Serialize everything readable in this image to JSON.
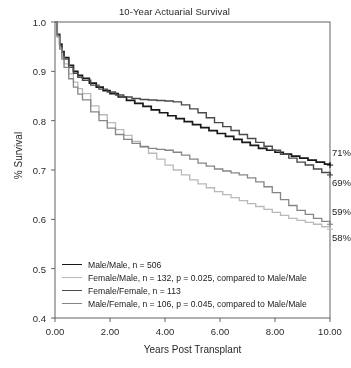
{
  "chart_data": {
    "type": "line",
    "title": "10-Year Actuarial Survival",
    "xlabel": "Years Post Transplant",
    "ylabel": "% Survival",
    "xlim": [
      0,
      10
    ],
    "ylim": [
      0.4,
      1.0
    ],
    "xticks": [
      "0.00",
      "2.00",
      "4.00",
      "6.00",
      "8.00",
      "10.00"
    ],
    "xtick_values": [
      0,
      2,
      4,
      6,
      8,
      10
    ],
    "yticks": [
      "0.4",
      "0.5",
      "0.6",
      "0.7",
      "0.8",
      "0.9",
      "1.0"
    ],
    "ytick_values": [
      0.4,
      0.5,
      0.6,
      0.7,
      0.8,
      0.9,
      1.0
    ],
    "grid": false,
    "legend_position": "lower-left-inside",
    "series": [
      {
        "name": "Male/Male",
        "label": "Male/Male, n = 506",
        "n": 506,
        "p_value": null,
        "color": "#1a1a1a",
        "width": 1.7,
        "endpoint_label": "71%",
        "endpoint_value": 0.71,
        "x": [
          0.0,
          0.08,
          0.17,
          0.25,
          0.33,
          0.5,
          0.67,
          0.83,
          1.0,
          1.25,
          1.5,
          1.75,
          2.0,
          2.3,
          2.6,
          2.9,
          3.2,
          3.5,
          3.8,
          4.1,
          4.4,
          4.7,
          5.0,
          5.3,
          5.6,
          5.9,
          6.2,
          6.5,
          6.8,
          7.1,
          7.4,
          7.7,
          8.0,
          8.3,
          8.6,
          8.9,
          9.2,
          9.5,
          9.8,
          10.0
        ],
        "y": [
          1.0,
          0.975,
          0.955,
          0.94,
          0.928,
          0.912,
          0.9,
          0.892,
          0.886,
          0.876,
          0.868,
          0.861,
          0.855,
          0.848,
          0.841,
          0.835,
          0.829,
          0.822,
          0.816,
          0.81,
          0.804,
          0.798,
          0.792,
          0.786,
          0.78,
          0.774,
          0.768,
          0.762,
          0.756,
          0.75,
          0.744,
          0.74,
          0.736,
          0.732,
          0.728,
          0.724,
          0.72,
          0.716,
          0.712,
          0.71
        ]
      },
      {
        "name": "Female/Male",
        "label": "Female/Male, n = 132, p = 0.025, compared to Male/Male",
        "n": 132,
        "p_value": 0.025,
        "color": "#b9b9b9",
        "width": 1.3,
        "endpoint_label": "58%",
        "endpoint_value": 0.58,
        "x": [
          0.0,
          0.08,
          0.17,
          0.25,
          0.33,
          0.5,
          0.67,
          0.83,
          1.0,
          1.3,
          1.6,
          1.9,
          2.2,
          2.5,
          2.8,
          3.1,
          3.4,
          3.7,
          4.0,
          4.3,
          4.6,
          4.9,
          5.2,
          5.5,
          5.8,
          6.1,
          6.4,
          6.7,
          7.0,
          7.3,
          7.6,
          7.9,
          8.2,
          8.5,
          8.8,
          9.1,
          9.4,
          9.7,
          10.0
        ],
        "y": [
          1.0,
          0.972,
          0.948,
          0.93,
          0.915,
          0.895,
          0.878,
          0.865,
          0.855,
          0.83,
          0.812,
          0.796,
          0.782,
          0.77,
          0.758,
          0.746,
          0.734,
          0.722,
          0.71,
          0.7,
          0.69,
          0.68,
          0.672,
          0.664,
          0.656,
          0.65,
          0.644,
          0.638,
          0.632,
          0.626,
          0.62,
          0.614,
          0.608,
          0.602,
          0.598,
          0.594,
          0.59,
          0.585,
          0.58
        ]
      },
      {
        "name": "Female/Female",
        "label": "Female/Female, n = 113",
        "n": 113,
        "p_value": null,
        "color": "#4a4a4a",
        "width": 1.4,
        "endpoint_label": "69%",
        "endpoint_value": 0.69,
        "x": [
          0.0,
          0.08,
          0.17,
          0.25,
          0.33,
          0.5,
          0.67,
          0.83,
          1.0,
          1.3,
          1.6,
          1.9,
          2.2,
          2.5,
          2.8,
          3.1,
          3.4,
          3.7,
          4.0,
          4.3,
          4.6,
          4.9,
          5.2,
          5.5,
          5.8,
          6.1,
          6.4,
          6.7,
          7.0,
          7.3,
          7.6,
          7.9,
          8.2,
          8.5,
          8.8,
          9.1,
          9.4,
          9.7,
          10.0
        ],
        "y": [
          1.0,
          0.974,
          0.952,
          0.938,
          0.925,
          0.908,
          0.896,
          0.888,
          0.882,
          0.872,
          0.864,
          0.858,
          0.852,
          0.848,
          0.845,
          0.843,
          0.842,
          0.841,
          0.84,
          0.838,
          0.832,
          0.824,
          0.816,
          0.806,
          0.796,
          0.788,
          0.78,
          0.772,
          0.764,
          0.756,
          0.748,
          0.74,
          0.732,
          0.724,
          0.716,
          0.71,
          0.702,
          0.695,
          0.69
        ]
      },
      {
        "name": "Male/Female",
        "label": "Male/Female, n = 106, p = 0.045, compared to Male/Male",
        "n": 106,
        "p_value": 0.045,
        "color": "#868686",
        "width": 1.3,
        "endpoint_label": "59%",
        "endpoint_value": 0.59,
        "x": [
          0.0,
          0.08,
          0.17,
          0.25,
          0.33,
          0.5,
          0.67,
          0.83,
          1.0,
          1.3,
          1.6,
          1.9,
          2.2,
          2.5,
          2.8,
          3.1,
          3.4,
          3.7,
          4.0,
          4.3,
          4.6,
          4.9,
          5.2,
          5.5,
          5.8,
          6.1,
          6.4,
          6.7,
          7.0,
          7.3,
          7.6,
          7.9,
          8.2,
          8.5,
          8.8,
          9.1,
          9.4,
          9.7,
          10.0
        ],
        "y": [
          1.0,
          0.97,
          0.945,
          0.925,
          0.908,
          0.885,
          0.868,
          0.854,
          0.842,
          0.818,
          0.8,
          0.785,
          0.772,
          0.762,
          0.754,
          0.748,
          0.744,
          0.742,
          0.74,
          0.736,
          0.73,
          0.722,
          0.714,
          0.708,
          0.702,
          0.698,
          0.694,
          0.69,
          0.684,
          0.676,
          0.666,
          0.654,
          0.64,
          0.628,
          0.618,
          0.61,
          0.602,
          0.596,
          0.59
        ]
      }
    ],
    "endpoint_annotations": [
      {
        "label": "71%",
        "value": 0.71,
        "series": "Male/Male"
      },
      {
        "label": "69%",
        "value": 0.69,
        "series": "Female/Female"
      },
      {
        "label": "59%",
        "value": 0.59,
        "series": "Male/Female"
      },
      {
        "label": "58%",
        "value": 0.58,
        "series": "Female/Male"
      }
    ]
  }
}
